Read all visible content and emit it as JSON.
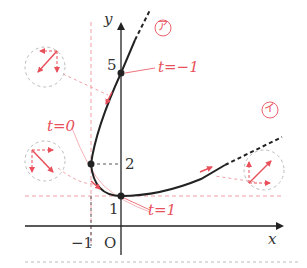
{
  "diagram": {
    "type": "parametric-curve-plot",
    "axes": {
      "x_label": "x",
      "y_label": "y",
      "origin_label": "O",
      "x_ticks": [
        "-1"
      ],
      "y_ticks": [
        "1",
        "2",
        "5"
      ]
    },
    "curve": {
      "description": "parametric curve passing through (0,5) at t=-1, (-1,2) at t=0, (0,1) at t=1",
      "points": [
        {
          "t": "-1",
          "x": 0,
          "y": 5,
          "label": "t=−1"
        },
        {
          "t": "0",
          "x": -1,
          "y": 2,
          "label": "t=0"
        },
        {
          "t": "1",
          "x": 0,
          "y": 1,
          "label": "t=1"
        }
      ],
      "branch_labels": [
        "ア",
        "イ"
      ]
    },
    "labels": {
      "t_minus1": "t=−1",
      "t_zero": "t=0",
      "t_one": "t=1",
      "branch_a": "ア",
      "branch_i": "イ",
      "y_five": "5",
      "y_two": "2",
      "y_one": "1",
      "x_minus1": "−1",
      "origin": "O",
      "x_axis": "x",
      "y_axis": "y"
    },
    "colors": {
      "curve": "#222222",
      "annotation": "#e8505b",
      "guide": "#f0a0a6",
      "axis": "#333333"
    }
  }
}
